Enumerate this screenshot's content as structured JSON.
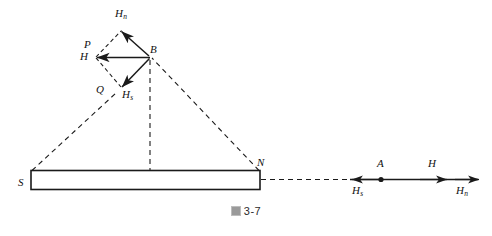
{
  "figure": {
    "caption_mark": "圖",
    "caption_number": "3-7",
    "caption_full": "圖 3-7"
  },
  "magnet": {
    "south_pole_label": "S",
    "north_pole_label": "N"
  },
  "field_point": {
    "label": "B"
  },
  "parallelogram": {
    "vertex_left_upper_label": "P",
    "vertex_left_lower_label": "H",
    "vertex_bottom_label": "Q",
    "vector_north_label": "H",
    "vector_north_sub": "n",
    "vector_south_label": "H",
    "vector_south_sub": "s"
  },
  "axial_point": {
    "point_label": "A",
    "resultant_label": "H",
    "south_component_label": "H",
    "south_component_sub": "s",
    "north_component_label": "H",
    "north_component_sub": "n"
  },
  "colors": {
    "stroke": "#1a1a1a",
    "background": "#ffffff",
    "caption": "#2b2b2b"
  }
}
